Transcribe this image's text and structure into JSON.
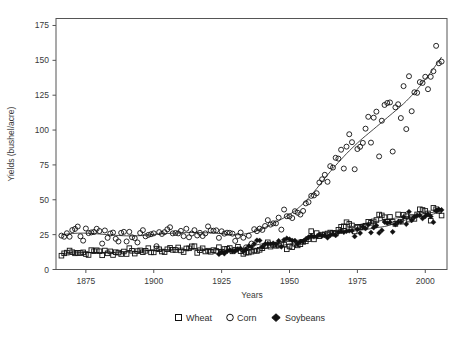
{
  "chart_data": {
    "type": "scatter",
    "title": "",
    "xlabel": "Years",
    "ylabel": "Yields (bushel/acre)",
    "xlim": [
      1864,
      2008
    ],
    "ylim": [
      0,
      180
    ],
    "xticks": [
      1875,
      1900,
      1925,
      1950,
      1975,
      2000
    ],
    "yticks": [
      0,
      25,
      50,
      75,
      100,
      125,
      150,
      175
    ],
    "grid": false,
    "legend_position": "below",
    "legend": [
      {
        "name": "Wheat",
        "marker": "open-square"
      },
      {
        "name": "Corn",
        "marker": "open-circle"
      },
      {
        "name": "Soybeans",
        "marker": "filled-diamond"
      }
    ],
    "series": [
      {
        "name": "Corn",
        "marker": "open-circle",
        "has_trend_line": true,
        "x": [
          1866,
          1867,
          1868,
          1869,
          1870,
          1871,
          1872,
          1873,
          1874,
          1875,
          1876,
          1877,
          1878,
          1879,
          1880,
          1881,
          1882,
          1883,
          1884,
          1885,
          1886,
          1887,
          1888,
          1889,
          1890,
          1891,
          1892,
          1893,
          1894,
          1895,
          1896,
          1897,
          1898,
          1899,
          1900,
          1901,
          1902,
          1903,
          1904,
          1905,
          1906,
          1907,
          1908,
          1909,
          1910,
          1911,
          1912,
          1913,
          1914,
          1915,
          1916,
          1917,
          1918,
          1919,
          1920,
          1921,
          1922,
          1923,
          1924,
          1925,
          1926,
          1927,
          1928,
          1929,
          1930,
          1931,
          1932,
          1933,
          1934,
          1935,
          1936,
          1937,
          1938,
          1939,
          1940,
          1941,
          1942,
          1943,
          1944,
          1945,
          1946,
          1947,
          1948,
          1949,
          1950,
          1951,
          1952,
          1953,
          1954,
          1955,
          1956,
          1957,
          1958,
          1959,
          1960,
          1961,
          1962,
          1963,
          1964,
          1965,
          1966,
          1967,
          1968,
          1969,
          1970,
          1971,
          1972,
          1973,
          1974,
          1975,
          1976,
          1977,
          1978,
          1979,
          1980,
          1981,
          1982,
          1983,
          1984,
          1985,
          1986,
          1987,
          1988,
          1989,
          1990,
          1991,
          1992,
          1993,
          1994,
          1995,
          1996,
          1997,
          1998,
          1999,
          2000,
          2001,
          2002,
          2003,
          2004,
          2005,
          2006
        ],
        "y": [
          24.3,
          23.5,
          26.0,
          23.5,
          28.3,
          29.1,
          30.8,
          23.8,
          20.7,
          29.4,
          26.1,
          26.6,
          26.9,
          29.2,
          27.6,
          18.6,
          28.0,
          22.7,
          25.8,
          26.5,
          22.0,
          20.1,
          26.3,
          27.0,
          20.1,
          27.0,
          23.1,
          22.5,
          19.4,
          26.2,
          28.2,
          23.8,
          24.8,
          25.3,
          25.9,
          16.7,
          26.8,
          25.5,
          26.8,
          28.8,
          30.3,
          25.9,
          26.2,
          25.9,
          27.7,
          23.9,
          29.2,
          23.1,
          25.8,
          28.2,
          24.4,
          26.3,
          24.0,
          25.9,
          30.9,
          28.0,
          27.8,
          28.1,
          22.7,
          27.4,
          25.7,
          26.4,
          26.3,
          25.7,
          20.5,
          24.0,
          26.5,
          22.8,
          15.9,
          24.2,
          18.6,
          28.9,
          27.5,
          29.3,
          28.4,
          31.2,
          35.4,
          32.2,
          33.1,
          33.1,
          37.2,
          28.6,
          43.0,
          38.2,
          38.2,
          36.9,
          41.8,
          40.7,
          39.4,
          42.0,
          47.4,
          48.3,
          52.8,
          53.1,
          54.7,
          62.4,
          64.7,
          67.9,
          62.9,
          74.1,
          73.1,
          80.1,
          79.5,
          85.9,
          72.4,
          88.1,
          97.0,
          91.3,
          71.9,
          86.4,
          88.0,
          90.8,
          101.0,
          109.5,
          91.0,
          108.9,
          113.2,
          81.1,
          106.7,
          118.0,
          119.4,
          119.8,
          84.6,
          116.3,
          118.5,
          108.6,
          131.5,
          100.7,
          138.6,
          113.5,
          127.1,
          126.7,
          134.4,
          133.8,
          138.2,
          129.3,
          138.2,
          142.2,
          160.4,
          147.9,
          149.1
        ]
      },
      {
        "name": "Wheat",
        "marker": "open-square",
        "has_trend_line": true,
        "x": [
          1866,
          1867,
          1868,
          1869,
          1870,
          1871,
          1872,
          1873,
          1874,
          1875,
          1876,
          1877,
          1878,
          1879,
          1880,
          1881,
          1882,
          1883,
          1884,
          1885,
          1886,
          1887,
          1888,
          1889,
          1890,
          1891,
          1892,
          1893,
          1894,
          1895,
          1896,
          1897,
          1898,
          1899,
          1900,
          1901,
          1902,
          1903,
          1904,
          1905,
          1906,
          1907,
          1908,
          1909,
          1910,
          1911,
          1912,
          1913,
          1914,
          1915,
          1916,
          1917,
          1918,
          1919,
          1920,
          1921,
          1922,
          1923,
          1924,
          1925,
          1926,
          1927,
          1928,
          1929,
          1930,
          1931,
          1932,
          1933,
          1934,
          1935,
          1936,
          1937,
          1938,
          1939,
          1940,
          1941,
          1942,
          1943,
          1944,
          1945,
          1946,
          1947,
          1948,
          1949,
          1950,
          1951,
          1952,
          1953,
          1954,
          1955,
          1956,
          1957,
          1958,
          1959,
          1960,
          1961,
          1962,
          1963,
          1964,
          1965,
          1966,
          1967,
          1968,
          1969,
          1970,
          1971,
          1972,
          1973,
          1974,
          1975,
          1976,
          1977,
          1978,
          1979,
          1980,
          1981,
          1982,
          1983,
          1984,
          1985,
          1986,
          1987,
          1988,
          1989,
          1990,
          1991,
          1992,
          1993,
          1994,
          1995,
          1996,
          1997,
          1998,
          1999,
          2000,
          2001,
          2002,
          2003,
          2004,
          2005,
          2006
        ],
        "y": [
          9.9,
          11.6,
          12.1,
          13.6,
          12.4,
          11.6,
          12.0,
          11.8,
          12.3,
          11.1,
          10.4,
          13.9,
          13.1,
          13.8,
          13.1,
          10.2,
          13.6,
          11.6,
          13.0,
          10.4,
          12.4,
          12.1,
          11.1,
          12.9,
          11.1,
          15.3,
          13.4,
          11.4,
          13.2,
          13.7,
          12.4,
          13.4,
          15.3,
          12.3,
          12.3,
          15.0,
          14.5,
          12.9,
          12.5,
          14.5,
          15.5,
          14.1,
          14.0,
          15.8,
          13.7,
          12.5,
          15.1,
          15.2,
          16.6,
          16.7,
          11.9,
          13.8,
          15.2,
          12.9,
          13.5,
          12.7,
          13.9,
          13.3,
          16.0,
          12.8,
          14.7,
          14.8,
          15.4,
          13.0,
          14.2,
          16.3,
          13.1,
          11.2,
          12.1,
          12.2,
          12.8,
          13.6,
          13.3,
          14.1,
          15.3,
          16.8,
          19.5,
          16.4,
          17.7,
          17.0,
          17.2,
          18.2,
          17.9,
          14.5,
          16.5,
          16.0,
          18.4,
          17.3,
          18.1,
          19.8,
          20.2,
          21.8,
          27.5,
          21.6,
          26.1,
          23.9,
          25.0,
          25.2,
          25.8,
          26.5,
          26.3,
          25.8,
          28.5,
          30.6,
          31.0,
          33.9,
          32.7,
          31.6,
          27.3,
          30.6,
          30.3,
          30.7,
          31.4,
          34.2,
          33.5,
          34.5,
          35.5,
          39.4,
          38.8,
          37.5,
          34.4,
          37.7,
          34.1,
          32.7,
          39.5,
          34.3,
          39.3,
          38.2,
          35.8,
          37.6,
          36.3,
          39.5,
          43.2,
          42.7,
          42.0,
          40.2,
          35.0,
          44.2,
          43.2,
          42.0,
          38.7
        ]
      },
      {
        "name": "Soybeans",
        "marker": "filled-diamond",
        "has_trend_line": true,
        "x": [
          1924,
          1925,
          1926,
          1927,
          1928,
          1929,
          1930,
          1931,
          1932,
          1933,
          1934,
          1935,
          1936,
          1937,
          1938,
          1939,
          1940,
          1941,
          1942,
          1943,
          1944,
          1945,
          1946,
          1947,
          1948,
          1949,
          1950,
          1951,
          1952,
          1953,
          1954,
          1955,
          1956,
          1957,
          1958,
          1959,
          1960,
          1961,
          1962,
          1963,
          1964,
          1965,
          1966,
          1967,
          1968,
          1969,
          1970,
          1971,
          1972,
          1973,
          1974,
          1975,
          1976,
          1977,
          1978,
          1979,
          1980,
          1981,
          1982,
          1983,
          1984,
          1985,
          1986,
          1987,
          1988,
          1989,
          1990,
          1991,
          1992,
          1993,
          1994,
          1995,
          1996,
          1997,
          1998,
          1999,
          2000,
          2001,
          2002,
          2003,
          2004,
          2005,
          2006
        ],
        "y": [
          11.0,
          12.5,
          11.4,
          13.0,
          13.9,
          13.0,
          13.4,
          14.7,
          15.0,
          12.9,
          14.6,
          16.8,
          16.3,
          18.4,
          20.9,
          20.8,
          16.2,
          18.2,
          18.5,
          18.3,
          18.8,
          18.0,
          20.5,
          16.3,
          21.3,
          22.3,
          21.7,
          20.8,
          20.7,
          18.2,
          20.0,
          20.1,
          21.8,
          23.2,
          24.2,
          23.5,
          23.5,
          25.1,
          24.2,
          24.4,
          22.8,
          24.5,
          25.4,
          24.5,
          26.7,
          27.4,
          26.7,
          27.5,
          27.8,
          27.8,
          23.7,
          28.9,
          26.1,
          30.6,
          29.4,
          32.1,
          26.5,
          30.1,
          31.5,
          26.2,
          28.1,
          34.1,
          33.3,
          33.9,
          27.0,
          32.3,
          34.1,
          34.2,
          37.6,
          32.6,
          41.4,
          35.3,
          37.6,
          38.9,
          38.9,
          36.6,
          38.1,
          39.6,
          38.0,
          33.9,
          42.2,
          43.1,
          42.7
        ]
      }
    ]
  },
  "axes": {
    "y_label": "Yields (bushel/acre)",
    "x_label": "Years",
    "y_tick_labels": [
      "175",
      "150",
      "125",
      "100",
      "75",
      "50",
      "25",
      "0"
    ],
    "x_tick_labels": [
      "1875",
      "1900",
      "1925",
      "1950",
      "1975",
      "2000"
    ]
  },
  "legend": {
    "wheat_label": "Wheat",
    "corn_label": "Corn",
    "soybeans_label": "Soybeans"
  },
  "colors": {
    "marker_stroke": "#111111",
    "trend_line": "#1a1a1a",
    "frame": "#555555",
    "text": "#3a3a3a",
    "background": "#ffffff"
  }
}
